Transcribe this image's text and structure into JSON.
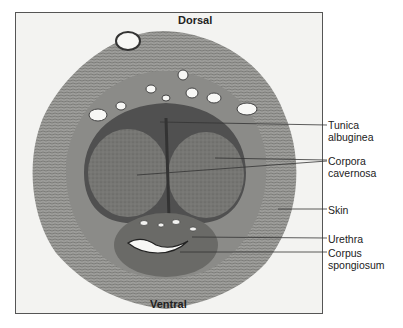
{
  "figure": {
    "orientation": {
      "top": "Dorsal",
      "bottom": "Ventral"
    },
    "labels": [
      {
        "id": "tunica-albuginea",
        "line1": "Tunica",
        "line2": "albuginea"
      },
      {
        "id": "corpora-cavernosa",
        "line1": "Corpora",
        "line2": "cavernosa"
      },
      {
        "id": "skin",
        "line1": "Skin",
        "line2": ""
      },
      {
        "id": "urethra",
        "line1": "Urethra",
        "line2": ""
      },
      {
        "id": "corpus-spongiosum",
        "line1": "Corpus",
        "line2": "spongiosum"
      }
    ],
    "colors": {
      "background": "#f3f3f1",
      "outer_tissue": "#a9a9a6",
      "mid_tissue": "#7c7c79",
      "inner_tissue": "#5d5d5b",
      "text": "#222222"
    }
  }
}
